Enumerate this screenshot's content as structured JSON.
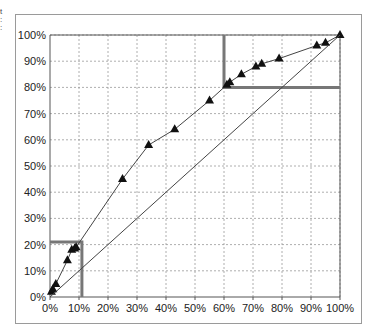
{
  "chart_data": {
    "type": "line",
    "title": "",
    "xlabel": "",
    "ylabel": "",
    "xlim": [
      0,
      100
    ],
    "ylim": [
      0,
      100
    ],
    "grid": true,
    "x_ticks": [
      "0%",
      "10%",
      "20%",
      "30%",
      "40%",
      "50%",
      "60%",
      "70%",
      "80%",
      "90%",
      "100%"
    ],
    "y_ticks": [
      "0%",
      "10%",
      "20%",
      "30%",
      "40%",
      "50%",
      "60%",
      "70%",
      "80%",
      "90%",
      "100%"
    ],
    "series": [
      {
        "name": "Cumulative curve",
        "marker": "triangle",
        "x": [
          0.5,
          1,
          2,
          6,
          7.5,
          8.5,
          9,
          25,
          34,
          43,
          55,
          61,
          62,
          66,
          71,
          73,
          79,
          92,
          95,
          100
        ],
        "y": [
          2,
          3,
          5,
          14,
          18,
          18.5,
          19,
          45,
          58,
          64,
          75,
          81,
          82,
          85,
          88,
          89,
          91,
          96,
          97,
          100
        ]
      },
      {
        "name": "Diagonal",
        "marker": "none",
        "x": [
          0,
          100
        ],
        "y": [
          0,
          100
        ]
      }
    ],
    "annotations": [
      {
        "type": "box",
        "x": [
          0,
          11
        ],
        "y": [
          0,
          21
        ]
      },
      {
        "type": "box",
        "x": [
          60,
          100
        ],
        "y": [
          80,
          100
        ]
      }
    ]
  }
}
